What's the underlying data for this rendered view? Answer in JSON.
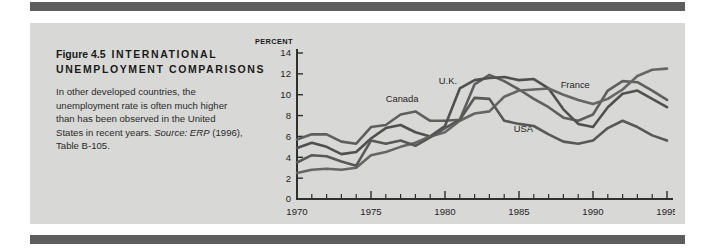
{
  "page": {
    "background_color": "#ffffff",
    "panel_color": "#d8d8d6",
    "rule_color": "#5d5d5d"
  },
  "caption": {
    "figure_number": "Figure 4.5",
    "title": "INTERNATIONAL UNEMPLOYMENT COMPARISONS",
    "body_line_1": "In other developed countries, the",
    "body_line_2": "unemployment rate is often much higher",
    "body_line_3": "than has been observed in the United",
    "body_line_4_pre": "States in recent years. ",
    "body_source_italic": "Source: ERP",
    "body_line_4_post": " (1996),",
    "body_line_5": "Table B-105."
  },
  "chart_data": {
    "type": "line",
    "title": "International Unemployment Comparisons",
    "xlabel": "",
    "ylabel": "PERCENT",
    "y_unit_label": "PERCENT",
    "xlim": [
      1970,
      1995
    ],
    "ylim": [
      0,
      14
    ],
    "grid": false,
    "legend_position": "inline-annotations",
    "x_tick_labels": [
      "1970",
      "1975",
      "1980",
      "1985",
      "1990",
      "1995"
    ],
    "x_tick_values": [
      1970,
      1975,
      1980,
      1985,
      1990,
      1995
    ],
    "x_minor_tick_values": [
      1971,
      1972,
      1973,
      1974,
      1976,
      1977,
      1978,
      1979,
      1981,
      1982,
      1983,
      1984,
      1986,
      1987,
      1988,
      1989,
      1991,
      1992,
      1993,
      1994
    ],
    "y_tick_labels": [
      "0",
      "2",
      "4",
      "6",
      "8",
      "10",
      "12",
      "14"
    ],
    "y_tick_values": [
      0,
      2,
      4,
      6,
      8,
      10,
      12,
      14
    ],
    "x": [
      1970,
      1971,
      1972,
      1973,
      1974,
      1975,
      1976,
      1977,
      1978,
      1979,
      1980,
      1981,
      1982,
      1983,
      1984,
      1985,
      1986,
      1987,
      1988,
      1989,
      1990,
      1991,
      1992,
      1993,
      1994,
      1995
    ],
    "series": [
      {
        "name": "Canada",
        "color": "#5f5f5f",
        "label_x": 1977.1,
        "label_y": 9.3,
        "values": [
          5.7,
          6.2,
          6.2,
          5.5,
          5.3,
          6.9,
          7.1,
          8.1,
          8.4,
          7.5,
          7.5,
          7.6,
          11.0,
          11.9,
          11.3,
          10.5,
          9.6,
          8.8,
          7.8,
          7.5,
          8.1,
          10.4,
          11.3,
          11.2,
          10.4,
          9.5
        ],
        "endpoint_value": 9.5
      },
      {
        "name": "U.K.",
        "color": "#505050",
        "label_x": 1980.2,
        "label_y": 11.0,
        "values": [
          4.9,
          5.4,
          5.0,
          4.3,
          4.5,
          5.8,
          6.8,
          7.1,
          6.4,
          6.0,
          7.0,
          10.6,
          11.4,
          11.6,
          11.7,
          11.4,
          11.5,
          10.6,
          8.6,
          7.2,
          6.9,
          8.8,
          10.1,
          10.4,
          9.6,
          8.8
        ],
        "endpoint_value": 8.8
      },
      {
        "name": "France",
        "color": "#666666",
        "label_x": 1988.8,
        "label_y": 10.6,
        "values": [
          2.5,
          2.8,
          2.9,
          2.8,
          3.0,
          4.2,
          4.5,
          5.0,
          5.4,
          6.0,
          6.4,
          7.5,
          8.2,
          8.4,
          9.8,
          10.4,
          10.5,
          10.6,
          10.0,
          9.5,
          9.1,
          9.6,
          10.5,
          11.8,
          12.4,
          12.5
        ],
        "endpoint_value": 12.5
      },
      {
        "name": "USA",
        "color": "#585858",
        "label_x": 1985.3,
        "label_y": 6.4,
        "values": [
          3.5,
          4.2,
          4.1,
          3.6,
          3.2,
          5.6,
          5.3,
          5.6,
          5.1,
          5.9,
          6.8,
          7.6,
          9.7,
          9.6,
          7.5,
          7.2,
          7.0,
          6.2,
          5.5,
          5.3,
          5.6,
          6.8,
          7.5,
          6.9,
          6.1,
          5.6
        ],
        "endpoint_value": 5.6
      }
    ]
  }
}
